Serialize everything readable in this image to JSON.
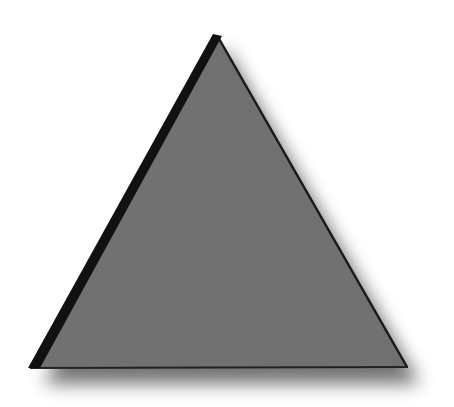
{
  "shape": {
    "type": "triangle",
    "apex": [
      216,
      35
    ],
    "bottom_left": [
      30,
      368
    ],
    "bottom_right": [
      408,
      367
    ],
    "fill": "#737373",
    "left_stroke": "#111111",
    "right_stroke": "#1a1a1a",
    "shadow_color": "#000000"
  }
}
